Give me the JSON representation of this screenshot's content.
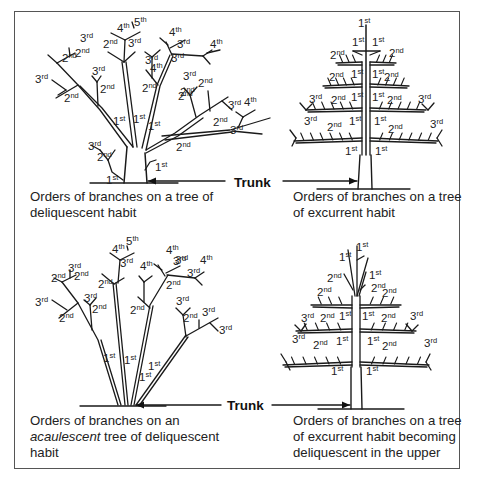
{
  "figure": {
    "trunk_label": "Trunk",
    "panels": [
      {
        "id": "deliquescent",
        "caption_lines": [
          "Orders of branches on a tree of",
          "deliquescent habit"
        ],
        "order_labels": [
          {
            "n": "4",
            "s": "th"
          },
          {
            "n": "5",
            "s": "th"
          },
          {
            "n": "4",
            "s": "th"
          },
          {
            "n": "3",
            "s": "rd"
          },
          {
            "n": "4",
            "s": "th"
          },
          {
            "n": "2",
            "s": "nd"
          },
          {
            "n": "3",
            "s": "rd"
          },
          {
            "n": "2",
            "s": "nd"
          },
          {
            "n": "3",
            "s": "rd"
          },
          {
            "n": "4",
            "s": "th"
          },
          {
            "n": "3",
            "s": "rd"
          },
          {
            "n": "3",
            "s": "rd"
          },
          {
            "n": "2",
            "s": "nd"
          },
          {
            "n": "3",
            "s": "rd"
          },
          {
            "n": "2",
            "s": "nd"
          },
          {
            "n": "3",
            "s": "rd"
          },
          {
            "n": "2",
            "s": "nd"
          },
          {
            "n": "2",
            "s": "nd"
          },
          {
            "n": "2",
            "s": "nd"
          },
          {
            "n": "3",
            "s": "rd"
          },
          {
            "n": "2",
            "s": "nd"
          },
          {
            "n": "2",
            "s": "nd"
          },
          {
            "n": "3",
            "s": "rd"
          },
          {
            "n": "4",
            "s": "th"
          },
          {
            "n": "1",
            "s": "st"
          },
          {
            "n": "1",
            "s": "st"
          },
          {
            "n": "1",
            "s": "st"
          },
          {
            "n": "3",
            "s": "rd"
          },
          {
            "n": "2",
            "s": "nd"
          },
          {
            "n": "2",
            "s": "nd"
          },
          {
            "n": "3",
            "s": "rd"
          },
          {
            "n": "2",
            "s": "nd"
          },
          {
            "n": "1",
            "s": "st"
          },
          {
            "n": "1",
            "s": "st"
          }
        ]
      },
      {
        "id": "excurrent",
        "caption_lines": [
          "Orders of branches on a tree",
          "of excurrent habit"
        ],
        "order_labels": [
          {
            "n": "1",
            "s": "st"
          },
          {
            "n": "1",
            "s": "st"
          },
          {
            "n": "1",
            "s": "st"
          },
          {
            "n": "2",
            "s": "nd"
          },
          {
            "n": "2",
            "s": "nd"
          },
          {
            "n": "2",
            "s": "nd"
          },
          {
            "n": "1",
            "s": "st"
          },
          {
            "n": "1",
            "s": "st"
          },
          {
            "n": "2",
            "s": "nd"
          },
          {
            "n": "3",
            "s": "rd"
          },
          {
            "n": "2",
            "s": "nd"
          },
          {
            "n": "1",
            "s": "st"
          },
          {
            "n": "1",
            "s": "st"
          },
          {
            "n": "2",
            "s": "nd"
          },
          {
            "n": "3",
            "s": "rd"
          },
          {
            "n": "3",
            "s": "rd"
          },
          {
            "n": "2",
            "s": "nd"
          },
          {
            "n": "1",
            "s": "st"
          },
          {
            "n": "1",
            "s": "st"
          },
          {
            "n": "2",
            "s": "nd"
          },
          {
            "n": "3",
            "s": "rd"
          },
          {
            "n": "1",
            "s": "st"
          },
          {
            "n": "1",
            "s": "st"
          }
        ]
      },
      {
        "id": "acaulescent",
        "caption_lines_parts": [
          [
            {
              "t": "Orders of branches on an",
              "i": false
            }
          ],
          [
            {
              "t": "acaulescent",
              "i": true
            },
            {
              "t": " tree of deliquescent",
              "i": false
            }
          ],
          [
            {
              "t": "habit",
              "i": false
            }
          ]
        ],
        "order_labels": [
          {
            "n": "4",
            "s": "th"
          },
          {
            "n": "5",
            "s": "th"
          },
          {
            "n": "4",
            "s": "th"
          },
          {
            "n": "3",
            "s": "rd"
          },
          {
            "n": "4",
            "s": "th"
          },
          {
            "n": "2",
            "s": "nd"
          },
          {
            "n": "3",
            "s": "rd"
          },
          {
            "n": "3",
            "s": "rd"
          },
          {
            "n": "4",
            "s": "th"
          },
          {
            "n": "3",
            "s": "rd"
          },
          {
            "n": "2",
            "s": "nd"
          },
          {
            "n": "3",
            "s": "rd"
          },
          {
            "n": "2",
            "s": "nd"
          },
          {
            "n": "3",
            "s": "rd"
          },
          {
            "n": "2",
            "s": "nd"
          },
          {
            "n": "3",
            "s": "rd"
          },
          {
            "n": "2",
            "s": "nd"
          },
          {
            "n": "2",
            "s": "nd"
          },
          {
            "n": "3",
            "s": "rd"
          },
          {
            "n": "2",
            "s": "nd"
          },
          {
            "n": "2",
            "s": "nd"
          },
          {
            "n": "3",
            "s": "rd"
          },
          {
            "n": "3",
            "s": "rd"
          },
          {
            "n": "1",
            "s": "st"
          },
          {
            "n": "1",
            "s": "st"
          },
          {
            "n": "1",
            "s": "st"
          },
          {
            "n": "1",
            "s": "st"
          }
        ]
      },
      {
        "id": "excurrent-deliquescent-upper",
        "caption_lines": [
          "Orders of branches on a tree",
          "of excurrent habit becoming",
          "deliquescent in the upper"
        ],
        "order_labels": [
          {
            "n": "1",
            "s": "st"
          },
          {
            "n": "1",
            "s": "st"
          },
          {
            "n": "2",
            "s": "nd"
          },
          {
            "n": "1",
            "s": "st"
          },
          {
            "n": "2",
            "s": "nd"
          },
          {
            "n": "2",
            "s": "nd"
          },
          {
            "n": "2",
            "s": "nd"
          },
          {
            "n": "3",
            "s": "rd"
          },
          {
            "n": "2",
            "s": "nd"
          },
          {
            "n": "1",
            "s": "st"
          },
          {
            "n": "1",
            "s": "st"
          },
          {
            "n": "2",
            "s": "nd"
          },
          {
            "n": "3",
            "s": "rd"
          },
          {
            "n": "3",
            "s": "rd"
          },
          {
            "n": "2",
            "s": "nd"
          },
          {
            "n": "1",
            "s": "st"
          },
          {
            "n": "1",
            "s": "st"
          },
          {
            "n": "2",
            "s": "nd"
          },
          {
            "n": "3",
            "s": "rd"
          },
          {
            "n": "1",
            "s": "st"
          },
          {
            "n": "1",
            "s": "st"
          }
        ]
      }
    ]
  }
}
